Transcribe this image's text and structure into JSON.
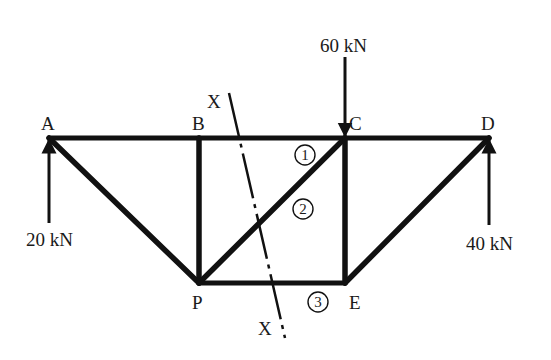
{
  "diagram": {
    "type": "truss",
    "nodes": [
      {
        "id": "A",
        "label": "A",
        "x": 49,
        "y": 138,
        "label_x": 41,
        "label_y": 130
      },
      {
        "id": "B",
        "label": "B",
        "x": 199,
        "y": 138,
        "label_x": 192,
        "label_y": 130
      },
      {
        "id": "C",
        "label": "C",
        "x": 345,
        "y": 138,
        "label_x": 349,
        "label_y": 130
      },
      {
        "id": "D",
        "label": "D",
        "x": 489,
        "y": 138,
        "label_x": 481,
        "label_y": 130
      },
      {
        "id": "P",
        "label": "P",
        "x": 199,
        "y": 283,
        "label_x": 192,
        "label_y": 309
      },
      {
        "id": "E",
        "label": "E",
        "x": 345,
        "y": 283,
        "label_x": 349,
        "label_y": 309
      }
    ],
    "members": [
      {
        "from": "A",
        "to": "B"
      },
      {
        "from": "B",
        "to": "C"
      },
      {
        "from": "C",
        "to": "D"
      },
      {
        "from": "A",
        "to": "P"
      },
      {
        "from": "B",
        "to": "P"
      },
      {
        "from": "P",
        "to": "C"
      },
      {
        "from": "C",
        "to": "E"
      },
      {
        "from": "P",
        "to": "E"
      },
      {
        "from": "E",
        "to": "D"
      }
    ],
    "member_markers": [
      {
        "label": "1",
        "x": 305,
        "y": 155
      },
      {
        "label": "2",
        "x": 303,
        "y": 209
      },
      {
        "label": "3",
        "x": 318,
        "y": 302
      }
    ],
    "loads": [
      {
        "label": "60 kN",
        "direction": "down",
        "at": "C",
        "x": 345,
        "y_start": 57,
        "y_end": 136,
        "label_x": 320,
        "label_y": 52
      },
      {
        "label": "20 kN",
        "direction": "up",
        "at": "A",
        "x": 49,
        "y_start": 223,
        "y_end": 140,
        "label_x": 26,
        "label_y": 246
      },
      {
        "label": "40 kN",
        "direction": "up",
        "at": "D",
        "x": 489,
        "y_start": 225,
        "y_end": 140,
        "label_x": 466,
        "label_y": 250
      }
    ],
    "section_line": {
      "label_top": "X",
      "label_bottom": "X",
      "x1": 229,
      "y1": 93,
      "x2": 285,
      "y2": 338,
      "label_top_x": 207,
      "label_top_y": 108,
      "label_bottom_x": 258,
      "label_bottom_y": 335
    }
  }
}
